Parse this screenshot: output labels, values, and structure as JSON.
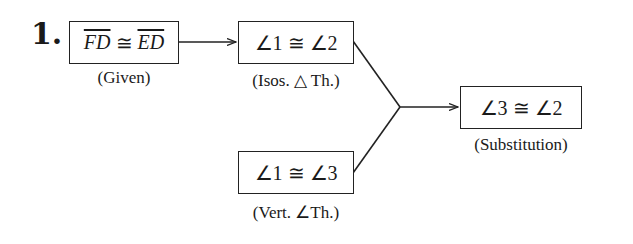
{
  "problem_number": "1.",
  "nodes": [
    {
      "id": "given",
      "statement_left": "FD",
      "statement_op": " ≅ ",
      "statement_right": "ED",
      "reason": "(Given)"
    },
    {
      "id": "isos",
      "statement": "∠1 ≅ ∠2",
      "reason": "(Isos. △ Th.)"
    },
    {
      "id": "vert",
      "statement": "∠1 ≅ ∠3",
      "reason": "(Vert. ∠Th.)"
    },
    {
      "id": "subst",
      "statement": "∠3 ≅ ∠2",
      "reason": "(Substitution)"
    }
  ],
  "edges": [
    {
      "from": "given",
      "to": "isos"
    },
    {
      "from": "isos",
      "to": "subst"
    },
    {
      "from": "vert",
      "to": "subst"
    }
  ]
}
